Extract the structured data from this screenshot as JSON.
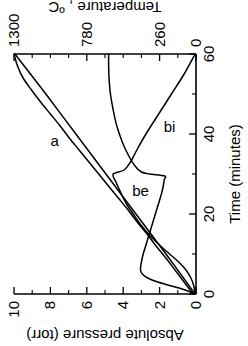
{
  "figure": {
    "orientation": "rotated-90-ccw",
    "background": "#ffffff",
    "ink": "#000000"
  },
  "chart_data": {
    "type": "line",
    "title": "",
    "xlabel": "Time (minutes)",
    "xlim": [
      0,
      60
    ],
    "xticks": [
      0,
      20,
      40,
      60
    ],
    "xtick_labels": [
      "0",
      "20",
      "40",
      "60"
    ],
    "xminor_step": 10,
    "ylabel": "Absolute pressure (torr)",
    "ylim": [
      0,
      10
    ],
    "yticks": [
      0,
      2,
      4,
      6,
      8,
      10
    ],
    "ytick_labels": [
      "0",
      "2",
      "4",
      "6",
      "8",
      "10"
    ],
    "yminor_step": 1,
    "y2label": "Temperature , ºC",
    "y2lim": [
      0,
      1300
    ],
    "y2ticks": [
      0,
      260,
      780,
      1300
    ],
    "y2tick_labels": [
      "0",
      "260",
      "780",
      "1300"
    ],
    "y2minor_step": 130,
    "grid": false,
    "legend_position": "inline-annotations",
    "series": [
      {
        "name": "a",
        "label": "a",
        "axis": "y2",
        "units": "ºC",
        "label_x": 37,
        "label_y": 1010,
        "x": [
          0,
          3,
          6,
          9,
          12,
          15,
          18,
          21,
          24,
          27,
          30,
          33,
          36,
          39,
          42,
          45,
          48,
          51,
          54,
          57,
          60
        ],
        "y": [
          20,
          85,
          150,
          215,
          285,
          350,
          420,
          485,
          555,
          625,
          695,
          765,
          835,
          905,
          970,
          1040,
          1110,
          1175,
          1235,
          1275,
          1300
        ]
      },
      {
        "name": "be",
        "label": "be",
        "axis": "y",
        "units": "torr",
        "label_x": 24.5,
        "label_y": 3.05,
        "x": [
          0,
          2,
          4,
          6,
          8,
          10,
          12,
          14,
          16,
          18,
          20,
          22,
          24,
          26,
          28,
          30,
          31,
          33,
          36,
          40,
          45,
          50,
          55,
          60
        ],
        "y": [
          0.05,
          0.12,
          0.28,
          0.55,
          0.95,
          1.45,
          1.95,
          2.4,
          2.8,
          3.15,
          3.45,
          3.75,
          4.0,
          4.2,
          4.4,
          4.55,
          3.95,
          3.6,
          3.25,
          2.75,
          2.05,
          1.35,
          0.65,
          0.05
        ]
      },
      {
        "name": "bi",
        "label": "bi",
        "axis": "y",
        "units": "torr",
        "label_x": 40.5,
        "label_y": 1.45,
        "x": [
          0,
          1,
          2,
          3,
          4,
          5,
          6,
          8,
          10,
          13,
          16,
          19,
          22,
          25,
          27,
          28.5,
          29.5,
          30,
          30.5,
          32,
          35,
          38,
          42,
          46,
          50,
          54,
          57,
          60
        ],
        "y": [
          0.05,
          0.6,
          1.35,
          2.1,
          2.65,
          2.95,
          3.05,
          3.0,
          2.9,
          2.7,
          2.5,
          2.3,
          2.1,
          1.9,
          1.8,
          1.75,
          1.72,
          2.55,
          3.0,
          3.35,
          3.75,
          4.05,
          4.35,
          4.55,
          4.7,
          4.78,
          4.8,
          4.8
        ]
      },
      {
        "name": "pressure-ramp",
        "label": "",
        "axis": "y",
        "units": "torr",
        "x": [
          0,
          10,
          20,
          30,
          40,
          50,
          60
        ],
        "y": [
          0.05,
          1.65,
          3.3,
          4.95,
          6.6,
          8.25,
          9.95
        ]
      }
    ]
  }
}
